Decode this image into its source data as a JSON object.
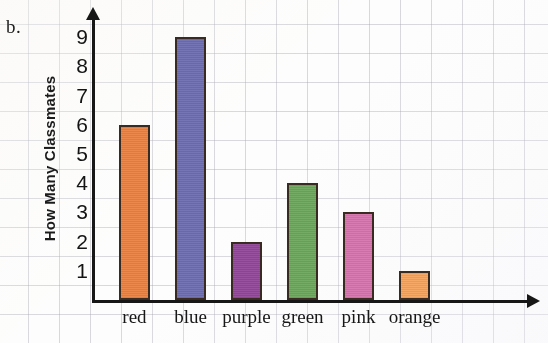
{
  "problem_label": "b.",
  "chart_data": {
    "type": "bar",
    "title": "",
    "xlabel": "",
    "ylabel": "How Many Classmates",
    "categories": [
      "red",
      "blue",
      "purple",
      "green",
      "pink",
      "orange"
    ],
    "values": [
      6,
      9,
      2,
      4,
      3,
      1
    ],
    "ylim": [
      0,
      9
    ],
    "yticks": [
      1,
      2,
      3,
      4,
      5,
      6,
      7,
      8,
      9
    ],
    "ytick_labels": [
      "1",
      "2",
      "3",
      "4",
      "5",
      "6",
      "7",
      "8",
      "9"
    ],
    "grid": true,
    "legend": "none",
    "bar_colors": [
      "#F0813F",
      "#6E6EB5",
      "#93479B",
      "#6BA85A",
      "#D973B0",
      "#F9A45C"
    ],
    "bar_outline_color": "#3A2A22",
    "axis_color": "#171717",
    "grid_color": "#8C8C9B",
    "background_color": "#FDFDFD",
    "y_axis_arrow": true,
    "x_axis_arrow": true
  }
}
